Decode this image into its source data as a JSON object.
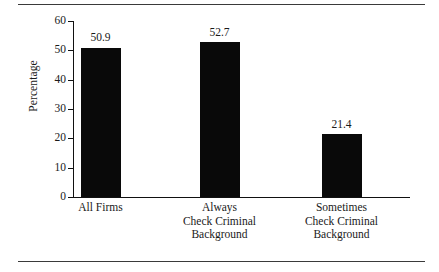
{
  "chart_data": {
    "type": "bar",
    "title": "",
    "subtitle": "",
    "xlabel": "",
    "ylabel": "Percentage",
    "ylim": [
      0,
      60
    ],
    "ytick_labels": [
      "0",
      "10",
      "20",
      "30",
      "40",
      "50",
      "60"
    ],
    "yticks": [
      0,
      10,
      20,
      30,
      40,
      50,
      60
    ],
    "grid": false,
    "legend": null,
    "bar_color": "#090909",
    "categories": [
      "All Firms",
      "Always Check Criminal Background",
      "Sometimes Check Criminal Background"
    ],
    "category_lines": [
      [
        "All Firms"
      ],
      [
        "Always",
        "Check Criminal",
        "Background"
      ],
      [
        "Sometimes",
        "Check Criminal",
        "Background"
      ]
    ],
    "values": [
      50.9,
      52.7,
      21.4
    ],
    "value_labels": [
      "50.9",
      "52.7",
      "21.4"
    ]
  }
}
